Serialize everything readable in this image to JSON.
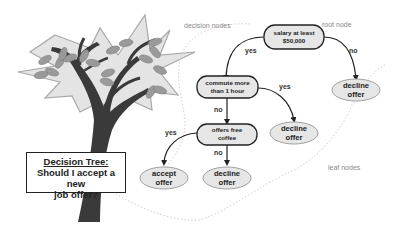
{
  "title": {
    "line1": "Decision Tree:",
    "line2": "Should I accept a new",
    "line3": "job offer?"
  },
  "annotations": {
    "decision_nodes": "decision nodes",
    "root_node": "root node",
    "leaf_nodes": "leaf nodes"
  },
  "nodes": {
    "root": {
      "line1": "salary at least",
      "line2": "$50,000"
    },
    "commute": {
      "line1": "commute more",
      "line2": "than 1 hour"
    },
    "coffee": {
      "line1": "offers free",
      "line2": "coffee"
    },
    "leaf_root_no": {
      "line1": "decline",
      "line2": "offer"
    },
    "leaf_commute_yes": {
      "line1": "decline",
      "line2": "offer"
    },
    "leaf_coffee_yes": {
      "line1": "accept",
      "line2": "offer"
    },
    "leaf_coffee_no": {
      "line1": "decline",
      "line2": "offer"
    }
  },
  "edges": {
    "root_yes": "yes",
    "root_no": "no",
    "commute_no": "no",
    "commute_yes": "yes",
    "coffee_yes": "yes",
    "coffee_no": "no"
  },
  "colors": {
    "node_fill": "#e6e6e6",
    "node_stroke": "#222222",
    "leaf_stroke": "#a0a0a0",
    "foliage_fill": "#e4e4e4",
    "foliage_stroke": "#a8a8a8",
    "trunk": "#3a3a3a",
    "leaf_shape": "#9a9a9a"
  }
}
